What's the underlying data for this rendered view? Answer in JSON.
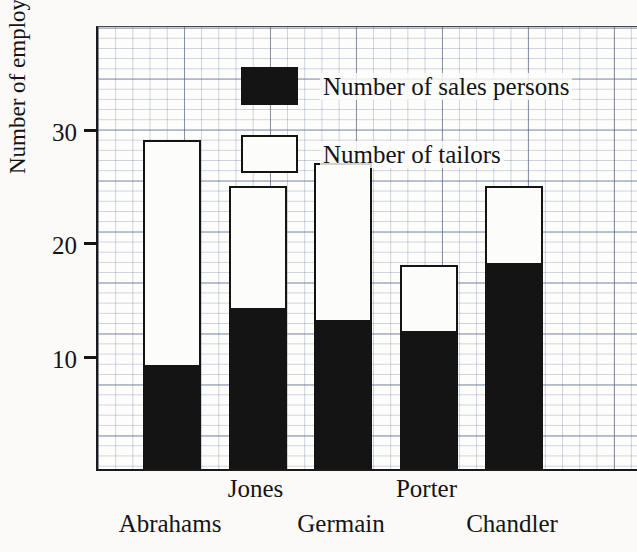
{
  "chart_data": {
    "type": "bar",
    "stacked": true,
    "title": "",
    "xlabel": "",
    "ylabel": "Number of employees",
    "categories": [
      "Abrahams",
      "Jones",
      "Germain",
      "Porter",
      "Chandler"
    ],
    "series": [
      {
        "name": "Number of sales persons",
        "color": "#141414",
        "values": [
          9,
          14,
          13,
          12,
          18
        ]
      },
      {
        "name": "Number of tailors",
        "color": "#fcfcfa",
        "values": [
          20,
          11,
          14,
          6,
          7
        ]
      }
    ],
    "totals": [
      29,
      25,
      27,
      18,
      25
    ],
    "ylim": [
      0,
      39
    ],
    "ytick_values": [
      10,
      20,
      30
    ],
    "ytick_labels": [
      "10",
      "20",
      "30"
    ],
    "grid": true,
    "grid_style": "graph-paper",
    "legend_position": "top-left-inside"
  },
  "axis": {
    "y_title": "Number of employees",
    "ticks": [
      {
        "label": "30",
        "value": 30
      },
      {
        "label": "20",
        "value": 20
      },
      {
        "label": "10",
        "value": 10
      }
    ]
  },
  "legend": {
    "items": [
      {
        "label": "Number of sales persons",
        "swatch": "filled"
      },
      {
        "label": "Number of tailors",
        "swatch": "hollow"
      }
    ]
  },
  "categories": [
    {
      "label": "Abrahams",
      "sales": 9,
      "tailors": 20,
      "total": 29
    },
    {
      "label": "Jones",
      "sales": 14,
      "tailors": 11,
      "total": 25
    },
    {
      "label": "Germain",
      "sales": 13,
      "tailors": 14,
      "total": 27
    },
    {
      "label": "Porter",
      "sales": 12,
      "tailors": 6,
      "total": 18
    },
    {
      "label": "Chandler",
      "sales": 18,
      "tailors": 7,
      "total": 25
    }
  ]
}
